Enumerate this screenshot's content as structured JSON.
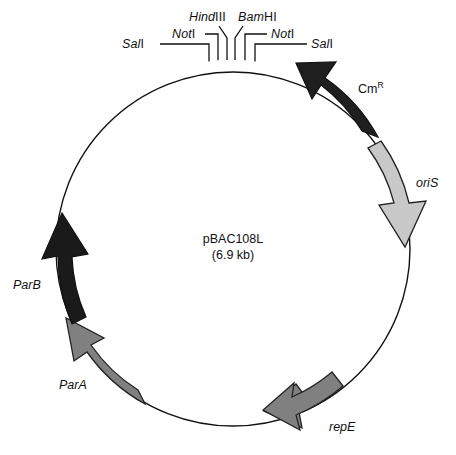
{
  "figure": {
    "name": "pBAC108L plasmid map",
    "background_color": "#ffffff",
    "line_color": "#111111"
  },
  "center": {
    "plasmid_name": "pBAC108L",
    "plasmid_size": "(6.9 kb)"
  },
  "circle": {
    "cx": 233,
    "cy": 249,
    "r": 177
  },
  "restriction_sites": [
    {
      "id": "sal-left",
      "label": "Sal",
      "numeral": "I",
      "italic": true,
      "angle_deg": -101.5
    },
    {
      "id": "not-left",
      "label": "Not",
      "numeral": "I",
      "italic": true,
      "angle_deg": -96.5
    },
    {
      "id": "hindiii",
      "label": "Hind",
      "numeral": "III",
      "italic": true,
      "angle_deg": -92.5
    },
    {
      "id": "bamhi",
      "label": "Bam",
      "numeral": "HI",
      "italic": true,
      "angle_deg": -88.0
    },
    {
      "id": "not-right",
      "label": "Not",
      "numeral": "I",
      "italic": true,
      "angle_deg": -83.5
    },
    {
      "id": "sal-right",
      "label": "Sal",
      "numeral": "I",
      "italic": true,
      "angle_deg": -78.5
    }
  ],
  "genes": [
    {
      "id": "cmr",
      "label": "Cm",
      "superscript": "R",
      "italic": false,
      "fill": "#1f1f1f",
      "stroke": "#111111",
      "start_deg": -36,
      "end_deg": -73,
      "direction": "counterclockwise"
    },
    {
      "id": "oris",
      "label": "oriS",
      "superscript": "",
      "italic": true,
      "fill": "#c8c8c8",
      "stroke": "#222222",
      "start_deg": -28,
      "end_deg": 2,
      "direction": "clockwise"
    },
    {
      "id": "repe",
      "label": "repE",
      "superscript": "",
      "italic": true,
      "fill": "#808080",
      "stroke": "#222222",
      "start_deg": 62,
      "end_deg": 92,
      "direction": "counterclockwise"
    },
    {
      "id": "para",
      "label": "ParA",
      "superscript": "",
      "italic": true,
      "fill": "#808080",
      "stroke": "#222222",
      "start_deg": 128,
      "end_deg": 160,
      "direction": "counterclockwise"
    },
    {
      "id": "parb",
      "label": "ParB",
      "superscript": "",
      "italic": true,
      "fill": "#1a1a1a",
      "stroke": "#111111",
      "start_deg": 164,
      "end_deg": 196,
      "direction": "counterclockwise"
    }
  ]
}
